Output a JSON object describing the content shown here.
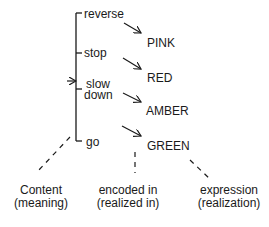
{
  "diagram": {
    "meanings": [
      {
        "label": "reverse"
      },
      {
        "label": "stop"
      },
      {
        "label_line1": "slow",
        "label_line2": "down"
      },
      {
        "label": "go"
      }
    ],
    "expressions": [
      "PINK",
      "RED",
      "AMBER",
      "GREEN"
    ],
    "bottom_labels": [
      {
        "line1": "Content",
        "line2": "(meaning)"
      },
      {
        "line1": "encoded in",
        "line2": "(realized in)"
      },
      {
        "line1": "expression",
        "line2": "(realization)"
      }
    ],
    "colors": {
      "ink": "#1a1a1a",
      "background": "#ffffff"
    }
  }
}
